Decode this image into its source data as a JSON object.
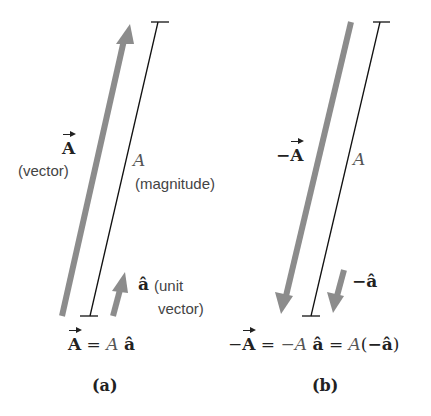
{
  "panels": {
    "a": {
      "vector_label": "A",
      "vector_note": "(vector)",
      "magnitude_symbol": "A",
      "magnitude_note": "(magnitude)",
      "unit_symbol": "â",
      "unit_note_line1": "(unit",
      "unit_note_line2": "vector)",
      "equation": {
        "lhs": "A",
        "eq": "=",
        "scalar": "A",
        "unit": "â"
      },
      "caption": "(a)"
    },
    "b": {
      "vector_prefix": "−",
      "vector_label": "A",
      "magnitude_symbol": "A",
      "unit_symbol": "−â",
      "equation": {
        "lhs_prefix": "−",
        "lhs": "A",
        "eq1": "=",
        "neg_scalar": "−A",
        "unit": "â",
        "eq2": "=",
        "scalar": "A",
        "paren_open": "(",
        "neg_unit": "−â",
        "paren_close": ")"
      },
      "caption": "(b)"
    }
  },
  "colors": {
    "arrow": "#8c8c8c",
    "line": "#111111",
    "text": "#222222"
  }
}
